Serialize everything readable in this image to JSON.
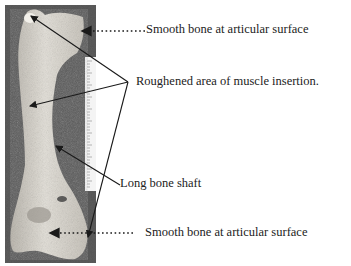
{
  "figure": {
    "labels": [
      {
        "id": "top-articular",
        "text": "Smooth bone at articular surface"
      },
      {
        "id": "muscle-insertion",
        "text": "Roughened area of muscle insertion."
      },
      {
        "id": "shaft",
        "text": "Long bone shaft"
      },
      {
        "id": "bottom-articular",
        "text": "Smooth bone at articular surface"
      }
    ]
  },
  "colors": {
    "background": "#ffffff",
    "photo_background": "#5a5a5a",
    "bone": "#d6d3cc",
    "text": "#222222",
    "arrow": "#1a1a1a"
  }
}
